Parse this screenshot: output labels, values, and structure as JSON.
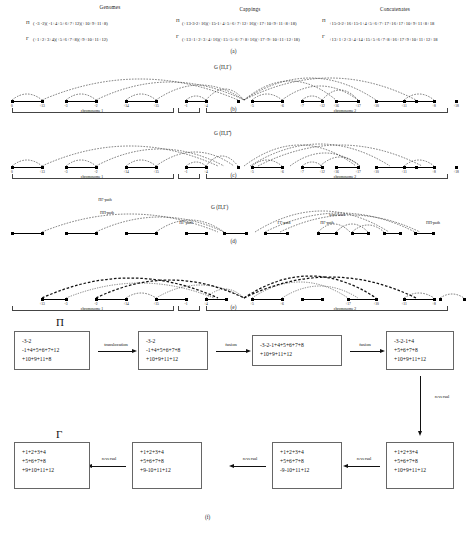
{
  "panel_a": {
    "headings": [
      "Genomes",
      "Cappings",
      "Concatenates"
    ],
    "rows": [
      {
        "symbol": "Π",
        "genome": "( -3 -2)( -1+4+5+6+7+12)(+10+9+11+8)",
        "capping": "(+13-3-2+16)(+15-1+4+5+6+7+12+16)(+17+10+9+11+8+18)",
        "concatenate": "+15-3-2+16+15-1+4+5+6+7+17+16+17+10+9+11+8+18"
      },
      {
        "symbol": "Γ",
        "genome": "(+1+2+3+4)(+5+6+7+8)(+9+10+11+12)",
        "capping": "(+13+1+2+3+4+16)(+15+5+6+7+8+16)(+17+9+10+11+12+18)",
        "concatenate": "+13+1+2+3+4+14+15+5+6+7+8+16+17+9+10+11+12+18"
      }
    ]
  },
  "panels": [
    {
      "id": "b",
      "caption": "(b)",
      "title": "G (Π,Γ)"
    },
    {
      "id": "c",
      "caption": "(c)",
      "title": "G (Π,Γ̂)"
    },
    {
      "id": "d",
      "caption": "(d)",
      "title": "G (Π,Γ)"
    },
    {
      "id": "e",
      "caption": "(e)",
      "title": ""
    }
  ],
  "graph": {
    "node_labels": [
      "0",
      "+13",
      "-3",
      "-2",
      "+14",
      "+15",
      "-1",
      "+4",
      "+5",
      "+6",
      "+7",
      "+12",
      "+16",
      "+17",
      "+10",
      "+9",
      "+11",
      "+8",
      "+18",
      "20"
    ],
    "chromosome_brackets": [
      {
        "label": "chromosome 1"
      },
      {
        "label": "chromosome 2"
      },
      {
        "label": "chromosome 3"
      }
    ]
  },
  "panel_d_paths": [
    {
      "label": "ΠΓ-path"
    },
    {
      "label": "ΠΠ-path"
    },
    {
      "label": "ΠΓ-path"
    },
    {
      "label": "ΓΓ-path"
    },
    {
      "label": "ΠΓ-path"
    },
    {
      "label": "semi-knot"
    },
    {
      "label": "ΠΠ-path"
    }
  ],
  "panel_f": {
    "caption": "(f)",
    "start_label": "Π",
    "end_label": "Γ",
    "boxes": [
      {
        "name": "box-pi",
        "lines": [
          "-3-2",
          "-1+4+5+6+7+12",
          "+10+9+11+8"
        ]
      },
      {
        "name": "box-2",
        "lines": [
          "-3-2",
          "-1+4+5+6+7+8",
          "+10+9+11+12"
        ]
      },
      {
        "name": "box-3",
        "lines": [
          "-3-2-1+4+5+6+7+8",
          "+10+9+11+12"
        ]
      },
      {
        "name": "box-4",
        "lines": [
          "-3-2-1+4",
          "+5+6+7+8",
          "+10+9+11+12"
        ]
      },
      {
        "name": "box-5",
        "lines": [
          "+1+2+3+4",
          "+5+6+7+8",
          "+10+9+11+12"
        ]
      },
      {
        "name": "box-6",
        "lines": [
          "+1+2+3+4",
          "+5+6+7+8",
          "-9-10+11+12"
        ]
      },
      {
        "name": "box-7",
        "lines": [
          "+1+2+3+4",
          "+5+6+7+8",
          "+9-10+11+12"
        ]
      },
      {
        "name": "box-gamma",
        "lines": [
          "+1+2+3+4",
          "+5+6+7+8",
          "+9+10+11+12"
        ]
      }
    ],
    "operations": [
      {
        "name": "op-translocation",
        "label": "translocation"
      },
      {
        "name": "op-fusion-1",
        "label": "fusion"
      },
      {
        "name": "op-fusion-2",
        "label": "fusion"
      },
      {
        "name": "op-reversal-1",
        "label": "reversal"
      },
      {
        "name": "op-reversal-2",
        "label": "reversal"
      },
      {
        "name": "op-reversal-3",
        "label": "reversal"
      },
      {
        "name": "op-reversal-4",
        "label": "reversal"
      }
    ]
  }
}
